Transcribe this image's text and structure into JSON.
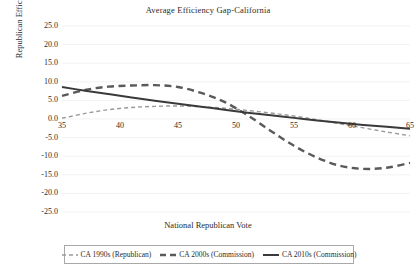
{
  "chart_data": {
    "type": "line",
    "title": "Average Efficiency Gap-California",
    "xlabel": "National Republican Vote",
    "ylabel": "Republican Efficiency Gap",
    "xlim": [
      35,
      65
    ],
    "ylim": [
      -25,
      25
    ],
    "xticks": [
      35,
      40,
      45,
      50,
      55,
      60,
      65
    ],
    "xtick_labels": [
      "35",
      "40",
      "45",
      "50",
      "55",
      "60",
      "65"
    ],
    "yticks": [
      25,
      20,
      15,
      10,
      5,
      0,
      -5,
      -10,
      -15,
      -20,
      -25
    ],
    "ytick_labels": [
      "25.0",
      "20.0",
      "15.0",
      "10.0",
      "5.0",
      "0.0",
      "-5.0",
      "-10.0",
      "-15.0",
      "-20.0",
      "-25.0"
    ],
    "grid": "horizontal-faint",
    "legend_position": "below-axes",
    "x": [
      35,
      37,
      39,
      41,
      43,
      45,
      47,
      49,
      51,
      53,
      55,
      57,
      59,
      61,
      63,
      65
    ],
    "series": [
      {
        "name": "CA 1990s (Republican)",
        "style": "dashed",
        "color": "#9a9a9a",
        "width": 1.4,
        "values": [
          0.2,
          1.5,
          2.5,
          3.1,
          3.4,
          3.5,
          3.3,
          2.9,
          2.3,
          1.6,
          0.8,
          -0.2,
          -1.3,
          -2.4,
          -3.5,
          -4.5
        ]
      },
      {
        "name": "CA 2000s (Commission)",
        "style": "dashed",
        "color": "#5a5a5a",
        "width": 2.4,
        "values": [
          6.2,
          7.8,
          8.7,
          9.0,
          9.1,
          8.6,
          7.0,
          4.6,
          1.0,
          -3.2,
          -7.2,
          -10.4,
          -12.6,
          -13.4,
          -13.1,
          -11.8
        ]
      },
      {
        "name": "CA 2010s (Commission)",
        "style": "solid",
        "color": "#3a3a3a",
        "width": 2.0,
        "values": [
          8.6,
          7.6,
          6.7,
          5.8,
          4.9,
          4.1,
          3.3,
          2.5,
          1.7,
          1.0,
          0.3,
          -0.4,
          -1.0,
          -1.6,
          -2.1,
          -2.6
        ]
      }
    ]
  },
  "legend": {
    "items": [
      {
        "label": "CA 1990s (Republican)"
      },
      {
        "label": "CA 2000s (Commission)"
      },
      {
        "label": "CA 2010s (Commission)"
      }
    ]
  }
}
